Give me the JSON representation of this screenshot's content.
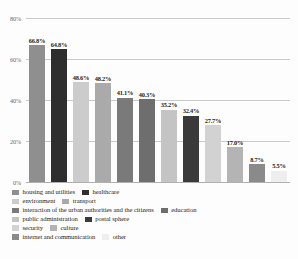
{
  "chart_data": {
    "type": "bar",
    "title": "",
    "xlabel": "",
    "ylabel": "",
    "ylim": [
      0,
      80
    ],
    "grid": true,
    "legend_position": "bottom",
    "categories": [
      "housing and utilities",
      "healthcare",
      "environment",
      "transport",
      "interaction of the urban authorities and the citizens",
      "education",
      "public administration",
      "postal sphere",
      "security",
      "culture",
      "internet and communication",
      "other"
    ],
    "values": [
      66.8,
      64.8,
      48.6,
      48.2,
      41.1,
      40.3,
      35.2,
      32.4,
      27.7,
      17.0,
      8.7,
      5.5
    ],
    "data_labels": [
      "66.8%",
      "64.8%",
      "48.6%",
      "48.2%",
      "41.1%",
      "40.3%",
      "35.2%",
      "32.4%",
      "27.7%",
      "17.0%",
      "8.7%",
      "5.5%"
    ],
    "colors": [
      "#8f8f8f",
      "#2e2e2e",
      "#cccccc",
      "#aaaaaa",
      "#7a7a7a",
      "#6e6e6e",
      "#c4c4c4",
      "#3a3a3a",
      "#d2d2d2",
      "#b4b4b4",
      "#8a8a8a",
      "#eeeeee"
    ],
    "ytick_labels": [
      "0%",
      "20%",
      "40%",
      "60%",
      "80%"
    ],
    "ytick_values": [
      0,
      20,
      40,
      60,
      80
    ]
  },
  "legend": {
    "rows": [
      [
        {
          "label": "housing and utilities",
          "color": "#8f8f8f"
        },
        {
          "label": "healthcare",
          "color": "#2e2e2e"
        }
      ],
      [
        {
          "label": "environment",
          "color": "#cccccc"
        },
        {
          "label": "transport",
          "color": "#aaaaaa"
        }
      ],
      [
        {
          "label": "interaction of the urban authorities and the citizens",
          "color": "#7a7a7a"
        },
        {
          "label": "education",
          "color": "#6e6e6e"
        }
      ],
      [
        {
          "label": "public administration",
          "color": "#c4c4c4"
        },
        {
          "label": "postal sphere",
          "color": "#3a3a3a"
        }
      ],
      [
        {
          "label": "security",
          "color": "#d2d2d2"
        },
        {
          "label": "culture",
          "color": "#b4b4b4"
        }
      ],
      [
        {
          "label": "internet and communication",
          "color": "#8a8a8a"
        },
        {
          "label": "other",
          "color": "#eeeeee"
        }
      ]
    ]
  }
}
